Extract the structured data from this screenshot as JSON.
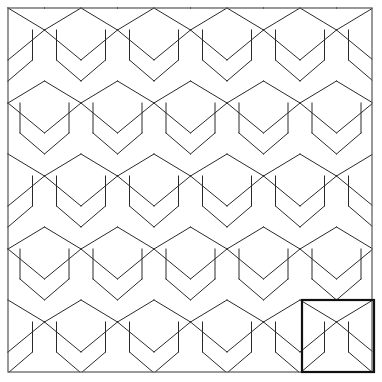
{
  "figure": {
    "description": "A repeating geometric tiling of elongated hexagonal goblet-shaped tiles arranged in offset horizontal rows, enclosed by a square frame, with one unit cell highlighted in the lower-right corner.",
    "background_color": "#ffffff",
    "line_color": "#2a2a2a",
    "frame_color": "#555555",
    "highlight_color": "#111111"
  },
  "canvas": {
    "width": 382,
    "height": 382
  },
  "frame": {
    "name": "outer-border",
    "x": 8,
    "y": 8,
    "width": 364,
    "height": 364
  },
  "unit_cell": {
    "name": "highlighted-unit-cell",
    "x": 302,
    "y": 300,
    "width": 72,
    "height": 72,
    "stroke_width": 2.2
  },
  "tiling": {
    "period_x": 73,
    "row_height": 73,
    "row_offset_x": 36.5,
    "rows": 5,
    "columns": 6,
    "apex_rise": 22,
    "shoulder_drop": 30,
    "waist_inset": 12,
    "first_row_top": 8,
    "first_peak_x": 8
  },
  "chart_data": {
    "type": "diagram",
    "tile_shape": "goblet hexagon",
    "symmetry": "offset rows, half-period horizontal shift",
    "unit_cell_size": 72,
    "rows": 5,
    "columns": 6
  }
}
